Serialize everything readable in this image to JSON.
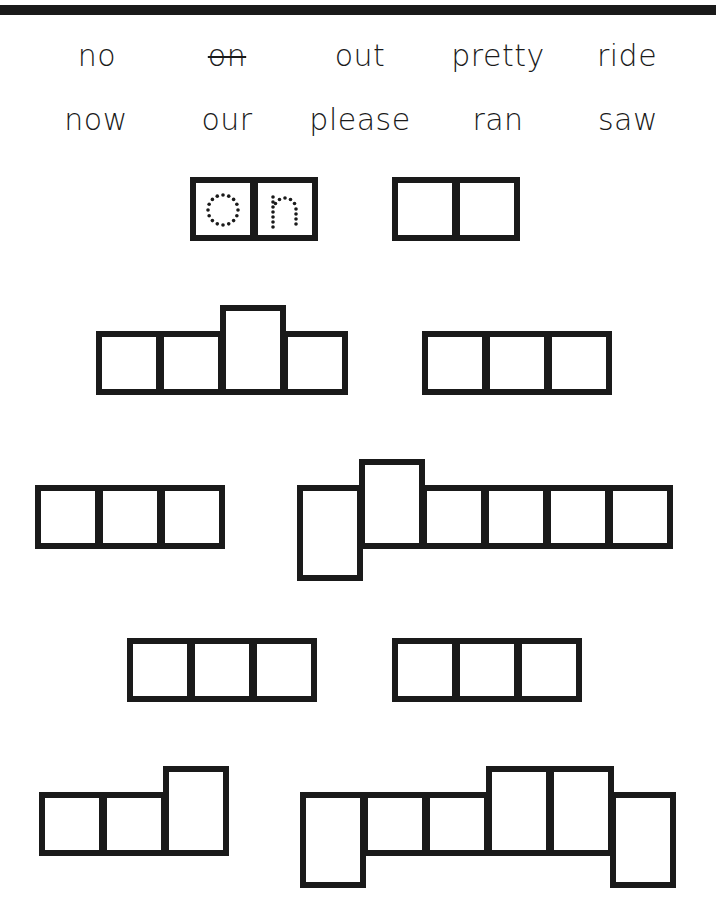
{
  "worksheet": {
    "word_bank": [
      {
        "text": "no",
        "crossed": false
      },
      {
        "text": "on",
        "crossed": true
      },
      {
        "text": "out",
        "crossed": false
      },
      {
        "text": "pretty",
        "crossed": false
      },
      {
        "text": "ride",
        "crossed": false
      },
      {
        "text": "now",
        "crossed": false
      },
      {
        "text": "our",
        "crossed": false
      },
      {
        "text": "please",
        "crossed": false
      },
      {
        "text": "ran",
        "crossed": false
      },
      {
        "text": "saw",
        "crossed": false
      }
    ],
    "word_shapes": [
      {
        "letters": [
          "short",
          "short"
        ],
        "traced": [
          "o",
          "n"
        ]
      },
      {
        "letters": [
          "short",
          "short"
        ]
      },
      {
        "letters": [
          "short",
          "short",
          "tall",
          "short"
        ]
      },
      {
        "letters": [
          "short",
          "short",
          "short"
        ]
      },
      {
        "letters": [
          "short",
          "short",
          "short"
        ]
      },
      {
        "letters": [
          "descender",
          "tall",
          "short",
          "short",
          "short",
          "short"
        ]
      },
      {
        "letters": [
          "short",
          "short",
          "short"
        ]
      },
      {
        "letters": [
          "short",
          "short",
          "short"
        ]
      },
      {
        "letters": [
          "short",
          "short",
          "tall"
        ]
      },
      {
        "letters": [
          "descender",
          "short",
          "short",
          "tall",
          "tall",
          "descender"
        ]
      }
    ],
    "trace_color": "#1a1a1a",
    "ink_color": "#1a1a1a"
  }
}
